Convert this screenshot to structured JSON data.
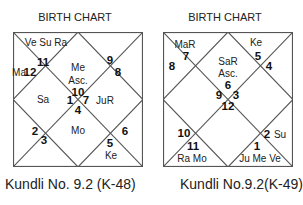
{
  "charts": [
    {
      "title": "BIRTH CHART",
      "caption": "Kundli No. 9.2 (K-48)",
      "labels": [
        {
          "t": "Ve Su Ra",
          "x": 33,
          "y": 10,
          "num": false
        },
        {
          "t": "11",
          "x": 30,
          "y": 30,
          "num": true
        },
        {
          "t": "Ma",
          "x": 6,
          "y": 40,
          "num": false
        },
        {
          "t": "12",
          "x": 17,
          "y": 40,
          "num": true
        },
        {
          "t": "Me",
          "x": 65,
          "y": 35,
          "num": false
        },
        {
          "t": "Asc.",
          "x": 65,
          "y": 48,
          "num": false
        },
        {
          "t": "10",
          "x": 65,
          "y": 60,
          "num": true
        },
        {
          "t": "9",
          "x": 97,
          "y": 28,
          "num": true
        },
        {
          "t": "8",
          "x": 105,
          "y": 40,
          "num": true
        },
        {
          "t": "Sa",
          "x": 30,
          "y": 67,
          "num": false
        },
        {
          "t": "1",
          "x": 57,
          "y": 68,
          "num": true
        },
        {
          "t": "7",
          "x": 73,
          "y": 68,
          "num": true
        },
        {
          "t": "JuR",
          "x": 92,
          "y": 68,
          "num": false
        },
        {
          "t": "4",
          "x": 65,
          "y": 78,
          "num": true
        },
        {
          "t": "Mo",
          "x": 65,
          "y": 98,
          "num": false
        },
        {
          "t": "2",
          "x": 22,
          "y": 99,
          "num": true
        },
        {
          "t": "3",
          "x": 31,
          "y": 108,
          "num": true
        },
        {
          "t": "6",
          "x": 112,
          "y": 99,
          "num": true
        },
        {
          "t": "5",
          "x": 97,
          "y": 111,
          "num": true
        },
        {
          "t": "Ke",
          "x": 98,
          "y": 123,
          "num": false
        }
      ]
    },
    {
      "title": "BIRTH CHART",
      "caption": "Kundli No.9.2(K-49)",
      "labels": [
        {
          "t": "MaR",
          "x": 22,
          "y": 12,
          "num": false
        },
        {
          "t": "7",
          "x": 23,
          "y": 24,
          "num": true
        },
        {
          "t": "8",
          "x": 9,
          "y": 34,
          "num": true
        },
        {
          "t": "Ke",
          "x": 93,
          "y": 10,
          "num": false
        },
        {
          "t": "5",
          "x": 95,
          "y": 24,
          "num": true
        },
        {
          "t": "4",
          "x": 106,
          "y": 34,
          "num": true
        },
        {
          "t": "SaR",
          "x": 65,
          "y": 29,
          "num": false
        },
        {
          "t": "Asc.",
          "x": 65,
          "y": 41,
          "num": false
        },
        {
          "t": "6",
          "x": 65,
          "y": 53,
          "num": true
        },
        {
          "t": "9",
          "x": 56,
          "y": 63,
          "num": true
        },
        {
          "t": "3",
          "x": 73,
          "y": 63,
          "num": true
        },
        {
          "t": "12",
          "x": 65,
          "y": 74,
          "num": true
        },
        {
          "t": "10",
          "x": 21,
          "y": 101,
          "num": true
        },
        {
          "t": "11",
          "x": 30,
          "y": 114,
          "num": true
        },
        {
          "t": "Ra Mo",
          "x": 29,
          "y": 126,
          "num": false
        },
        {
          "t": "2",
          "x": 104,
          "y": 102,
          "num": true
        },
        {
          "t": "Su",
          "x": 117,
          "y": 102,
          "num": false
        },
        {
          "t": "1",
          "x": 94,
          "y": 114,
          "num": true
        },
        {
          "t": "Ju Me Ve",
          "x": 97,
          "y": 126,
          "num": false
        }
      ]
    }
  ],
  "colors": {
    "line": "#555555",
    "text": "#222222"
  }
}
